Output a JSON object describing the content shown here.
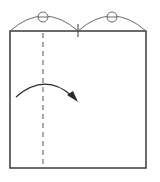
{
  "diagram": {
    "type": "origami-fold-instruction",
    "width": 160,
    "height": 182,
    "colors": {
      "background": "#ffffff",
      "paper_edge": "#3a3a3a",
      "arc": "#6a6a6a",
      "fold_line": "#555555",
      "arrow": "#2a2a2a"
    },
    "paper": {
      "x": 10,
      "y": 31,
      "width": 136,
      "height": 137
    },
    "top_arcs": [
      {
        "from": [
          10,
          31
        ],
        "to": [
          78,
          31
        ],
        "peak_y": 13,
        "marker_circle": {
          "cx": 43,
          "cy": 17,
          "r": 5
        }
      },
      {
        "from": [
          78,
          31
        ],
        "to": [
          146,
          31
        ],
        "peak_y": 13,
        "marker_circle": {
          "cx": 112,
          "cy": 17,
          "r": 5
        }
      }
    ],
    "center_tick": {
      "x": 78,
      "y1": 24,
      "y2": 37
    },
    "valley_fold_line": {
      "x": 43,
      "y1": 31,
      "y2": 168,
      "style": "dashed"
    },
    "fold_arrow": {
      "start": [
        16,
        97
      ],
      "control": [
        45,
        72
      ],
      "end": [
        76,
        100
      ],
      "direction": "right"
    }
  }
}
